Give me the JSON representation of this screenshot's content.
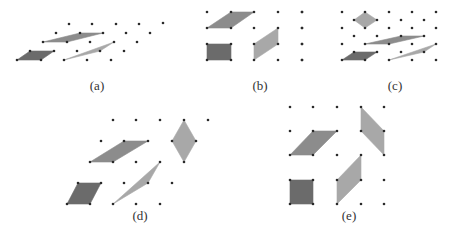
{
  "figure": {
    "colors": {
      "dark": "#6b6b6b",
      "medium": "#8c8c8c",
      "light": "#a8a8a8",
      "dot": "#2a2a2a"
    },
    "panels": [
      {
        "label": "(a)",
        "label_pos": [
          97,
          88
        ],
        "dots": [
          [
            69,
            24
          ],
          [
            92,
            24
          ],
          [
            116,
            24
          ],
          [
            139,
            24
          ],
          [
            56,
            33
          ],
          [
            80,
            33
          ],
          [
            103,
            33
          ],
          [
            126,
            33
          ],
          [
            150,
            33
          ],
          [
            43,
            42
          ],
          [
            67,
            42
          ],
          [
            90,
            42
          ],
          [
            114,
            42
          ],
          [
            137,
            42
          ],
          [
            30,
            51
          ],
          [
            54,
            51
          ],
          [
            77,
            51
          ],
          [
            100,
            51
          ],
          [
            124,
            51
          ],
          [
            17,
            60
          ],
          [
            41,
            60
          ],
          [
            64,
            60
          ],
          [
            87,
            60
          ],
          [
            111,
            60
          ]
        ],
        "shapes": [
          {
            "fill": "dark",
            "points": [
              [
                17,
                60
              ],
              [
                30,
                51
              ],
              [
                54,
                51
              ],
              [
                41,
                60
              ]
            ]
          },
          {
            "fill": "medium",
            "points": [
              [
                43,
                42
              ],
              [
                80,
                33
              ],
              [
                103,
                33
              ],
              [
                67,
                42
              ]
            ]
          },
          {
            "fill": "light",
            "points": [
              [
                64,
                60
              ],
              [
                114,
                42
              ],
              [
                100,
                51
              ],
              [
                64,
                60
              ]
            ]
          }
        ]
      },
      {
        "label": "(b)",
        "label_pos": [
          260,
          88
        ],
        "dots": [
          [
            207,
            12
          ],
          [
            231,
            12
          ],
          [
            254,
            12
          ],
          [
            278,
            12
          ],
          [
            302,
            12
          ],
          [
            207,
            28
          ],
          [
            231,
            28
          ],
          [
            254,
            28
          ],
          [
            278,
            28
          ],
          [
            302,
            28
          ],
          [
            207,
            44
          ],
          [
            231,
            44
          ],
          [
            254,
            44
          ],
          [
            278,
            44
          ],
          [
            302,
            44
          ],
          [
            207,
            60
          ],
          [
            231,
            60
          ],
          [
            254,
            60
          ],
          [
            278,
            60
          ],
          [
            302,
            60
          ],
          [
            163,
            23
          ]
        ],
        "shapes": [
          {
            "fill": "medium",
            "points": [
              [
                207,
                28
              ],
              [
                231,
                12
              ],
              [
                254,
                12
              ],
              [
                231,
                28
              ]
            ]
          },
          {
            "fill": "dark",
            "points": [
              [
                207,
                44
              ],
              [
                231,
                44
              ],
              [
                231,
                60
              ],
              [
                207,
                60
              ]
            ]
          },
          {
            "fill": "light",
            "points": [
              [
                254,
                44
              ],
              [
                278,
                28
              ],
              [
                278,
                44
              ],
              [
                254,
                60
              ]
            ]
          }
        ]
      },
      {
        "label": "(c)",
        "label_pos": [
          395,
          88
        ],
        "dots": [
          [
            302,
            12
          ],
          [
            342,
            12
          ],
          [
            365,
            12
          ],
          [
            389,
            12
          ],
          [
            412,
            12
          ],
          [
            436,
            12
          ],
          [
            354,
            20
          ],
          [
            377,
            20
          ],
          [
            401,
            20
          ],
          [
            424,
            20
          ],
          [
            302,
            28
          ],
          [
            342,
            28
          ],
          [
            365,
            28
          ],
          [
            389,
            28
          ],
          [
            412,
            28
          ],
          [
            436,
            28
          ],
          [
            354,
            36
          ],
          [
            377,
            36
          ],
          [
            401,
            36
          ],
          [
            424,
            36
          ],
          [
            302,
            44
          ],
          [
            342,
            44
          ],
          [
            365,
            44
          ],
          [
            389,
            44
          ],
          [
            412,
            44
          ],
          [
            436,
            44
          ],
          [
            354,
            52
          ],
          [
            377,
            52
          ],
          [
            401,
            52
          ],
          [
            424,
            52
          ],
          [
            302,
            60
          ],
          [
            342,
            60
          ],
          [
            365,
            60
          ],
          [
            389,
            60
          ],
          [
            412,
            60
          ],
          [
            436,
            60
          ]
        ],
        "shapes": [
          {
            "fill": "light",
            "points": [
              [
                354,
                20
              ],
              [
                365,
                12
              ],
              [
                377,
                20
              ],
              [
                365,
                28
              ]
            ]
          },
          {
            "fill": "medium",
            "points": [
              [
                365,
                44
              ],
              [
                401,
                36
              ],
              [
                424,
                36
              ],
              [
                389,
                44
              ]
            ]
          },
          {
            "fill": "dark",
            "points": [
              [
                342,
                60
              ],
              [
                354,
                52
              ],
              [
                377,
                52
              ],
              [
                365,
                60
              ]
            ]
          },
          {
            "fill": "light",
            "points": [
              [
                389,
                60
              ],
              [
                436,
                44
              ],
              [
                424,
                52
              ],
              [
                389,
                60
              ]
            ]
          }
        ]
      },
      {
        "label": "(d)",
        "label_pos": [
          140,
          218
        ],
        "dots": [
          [
            113,
            120
          ],
          [
            136,
            120
          ],
          [
            160,
            120
          ],
          [
            184,
            120
          ],
          [
            208,
            120
          ],
          [
            101,
            141
          ],
          [
            124,
            141
          ],
          [
            148,
            141
          ],
          [
            172,
            141
          ],
          [
            196,
            141
          ],
          [
            90,
            162
          ],
          [
            113,
            162
          ],
          [
            136,
            162
          ],
          [
            160,
            162
          ],
          [
            184,
            162
          ],
          [
            78,
            183
          ],
          [
            101,
            183
          ],
          [
            124,
            183
          ],
          [
            148,
            183
          ],
          [
            172,
            183
          ],
          [
            67,
            204
          ],
          [
            90,
            204
          ],
          [
            113,
            204
          ],
          [
            136,
            204
          ],
          [
            160,
            204
          ]
        ],
        "shapes": [
          {
            "fill": "medium",
            "points": [
              [
                90,
                162
              ],
              [
                124,
                141
              ],
              [
                148,
                141
              ],
              [
                113,
                162
              ]
            ]
          },
          {
            "fill": "light",
            "points": [
              [
                172,
                141
              ],
              [
                184,
                120
              ],
              [
                196,
                141
              ],
              [
                184,
                162
              ]
            ]
          },
          {
            "fill": "dark",
            "points": [
              [
                67,
                204
              ],
              [
                78,
                183
              ],
              [
                101,
                183
              ],
              [
                90,
                204
              ]
            ]
          },
          {
            "fill": "light",
            "points": [
              [
                113,
                204
              ],
              [
                160,
                162
              ],
              [
                148,
                183
              ],
              [
                113,
                204
              ]
            ]
          }
        ]
      },
      {
        "label": "(e)",
        "label_pos": [
          349,
          218
        ],
        "dots": [
          [
            290,
            107
          ],
          [
            313,
            107
          ],
          [
            337,
            107
          ],
          [
            361,
            107
          ],
          [
            384,
            107
          ],
          [
            290,
            131
          ],
          [
            313,
            131
          ],
          [
            337,
            131
          ],
          [
            361,
            131
          ],
          [
            384,
            131
          ],
          [
            290,
            155
          ],
          [
            313,
            155
          ],
          [
            337,
            155
          ],
          [
            361,
            155
          ],
          [
            384,
            155
          ],
          [
            290,
            180
          ],
          [
            313,
            180
          ],
          [
            337,
            180
          ],
          [
            361,
            180
          ],
          [
            384,
            180
          ],
          [
            290,
            204
          ],
          [
            313,
            204
          ],
          [
            337,
            204
          ],
          [
            361,
            204
          ],
          [
            384,
            204
          ]
        ],
        "shapes": [
          {
            "fill": "medium",
            "points": [
              [
                290,
                155
              ],
              [
                313,
                131
              ],
              [
                337,
                131
              ],
              [
                313,
                155
              ]
            ]
          },
          {
            "fill": "light",
            "points": [
              [
                361,
                107
              ],
              [
                384,
                131
              ],
              [
                384,
                155
              ],
              [
                361,
                131
              ]
            ]
          },
          {
            "fill": "dark",
            "points": [
              [
                290,
                180
              ],
              [
                313,
                180
              ],
              [
                313,
                204
              ],
              [
                290,
                204
              ]
            ]
          },
          {
            "fill": "light",
            "points": [
              [
                337,
                180
              ],
              [
                361,
                155
              ],
              [
                361,
                180
              ],
              [
                337,
                204
              ]
            ]
          }
        ]
      }
    ]
  }
}
